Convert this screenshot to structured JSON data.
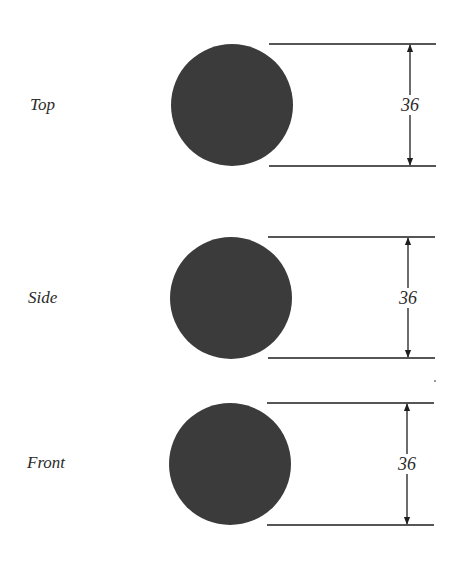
{
  "diagram": {
    "background": "#ffffff",
    "shape_color": "#3b3b3b",
    "line_color": "#1e1e1e",
    "views": [
      {
        "label": "Top",
        "label_pos": [
          30,
          109
        ],
        "circle": {
          "cx": 232,
          "cy": 105,
          "r": 61
        },
        "dimension": {
          "value": "36",
          "x": 410,
          "y_top": 44,
          "y_bottom": 166,
          "line_x1": 269,
          "line_x2": 436
        }
      },
      {
        "label": "Side",
        "label_pos": [
          28,
          302
        ],
        "circle": {
          "cx": 231,
          "cy": 298,
          "r": 61
        },
        "dimension": {
          "value": "36",
          "x": 408,
          "y_top": 237,
          "y_bottom": 358,
          "line_x1": 268,
          "line_x2": 435
        }
      },
      {
        "label": "Front",
        "label_pos": [
          27,
          467
        ],
        "circle": {
          "cx": 230,
          "cy": 464,
          "r": 61
        },
        "dimension": {
          "value": "36",
          "x": 407,
          "y_top": 403,
          "y_bottom": 525,
          "line_x1": 267,
          "line_x2": 434
        }
      }
    ]
  }
}
